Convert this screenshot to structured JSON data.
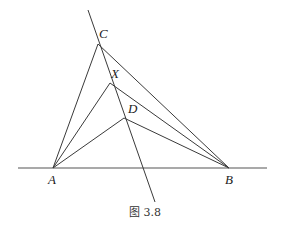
{
  "diagram": {
    "points": {
      "A": {
        "label": "A",
        "x": 53,
        "y": 168
      },
      "B": {
        "label": "B",
        "x": 229,
        "y": 168
      },
      "C": {
        "label": "C",
        "x": 98,
        "y": 44
      },
      "X": {
        "label": "X",
        "x": 110,
        "y": 83
      },
      "D": {
        "label": "D",
        "x": 124,
        "y": 118
      }
    },
    "caption": "图 3.8",
    "colors": {
      "line": "#3a3a3a",
      "baseline": "#555555",
      "text": "#222222"
    }
  }
}
